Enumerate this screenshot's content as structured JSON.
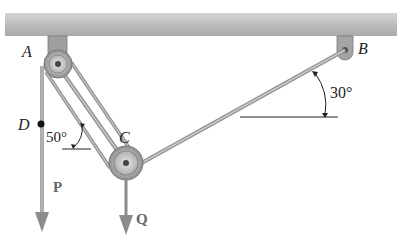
{
  "diagram": {
    "type": "pulley-cable-system",
    "ceiling": {
      "color": "#b5b5b5"
    },
    "points": {
      "A": {
        "label": "A",
        "x": 58,
        "y": 64
      },
      "B": {
        "label": "B",
        "x": 346,
        "y": 45
      },
      "C": {
        "label": "C",
        "x": 126,
        "y": 163
      },
      "D": {
        "label": "D",
        "x": 41,
        "y": 124
      }
    },
    "angles": {
      "angle_B": {
        "label": "30°"
      },
      "angle_C": {
        "label": "50°"
      }
    },
    "forces": {
      "P": {
        "label": "P"
      },
      "Q": {
        "label": "Q"
      }
    },
    "colors": {
      "cable": "#9a9a9a",
      "arrow": "#8c8c8c",
      "pulley": "#a8a8a8",
      "text": "#222222"
    }
  }
}
